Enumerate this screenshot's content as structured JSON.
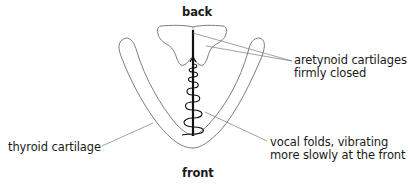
{
  "diagram": {
    "orientation_labels": {
      "top": "back",
      "bottom": "front"
    },
    "annotations": [
      {
        "id": "arytenoid",
        "lines": [
          "aretynoid cartilages",
          "firmly closed"
        ]
      },
      {
        "id": "vocal-folds",
        "lines": [
          "vocal folds, vibrating",
          "more slowly at the front"
        ]
      },
      {
        "id": "thyroid",
        "lines": [
          "thyroid cartilage"
        ]
      }
    ],
    "colors": {
      "outline": "#6e6e6e",
      "leader_line": "#7a7a7a",
      "vocal_fold": "#111111",
      "text": "#1a1a1a",
      "background": "#ffffff"
    }
  }
}
